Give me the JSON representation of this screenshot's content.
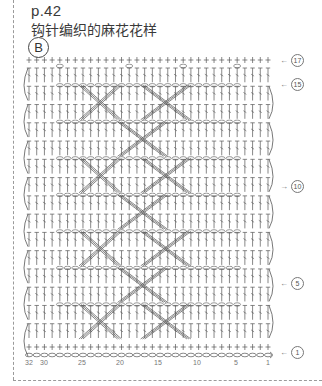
{
  "header": {
    "page_ref": "p.42",
    "title": "钩针编织的麻花花样",
    "badge": "B"
  },
  "chart": {
    "stitch_count": 32,
    "row_count": 17,
    "row_markers": [
      {
        "row": 17,
        "label": "17",
        "arrow": "←",
        "y": 60
      },
      {
        "row": 15,
        "label": "15",
        "arrow": "←",
        "y": 84
      },
      {
        "row": 10,
        "label": "10",
        "arrow": "→",
        "y": 186
      },
      {
        "row": 5,
        "label": "5",
        "arrow": "←",
        "y": 283
      },
      {
        "row": 1,
        "label": "1",
        "arrow": "←",
        "y": 352
      }
    ],
    "stitch_labels": [
      {
        "label": "32",
        "x": 29
      },
      {
        "label": "30",
        "x": 44
      },
      {
        "label": "25",
        "x": 82
      },
      {
        "label": "20",
        "x": 120
      },
      {
        "label": "15",
        "x": 158
      },
      {
        "label": "10",
        "x": 197
      },
      {
        "label": "5",
        "x": 236
      },
      {
        "label": "1",
        "x": 268
      }
    ],
    "symbols": {
      "single_crochet": "+",
      "double_crochet": "T",
      "chain": "oval",
      "cable_cross": "X"
    }
  }
}
